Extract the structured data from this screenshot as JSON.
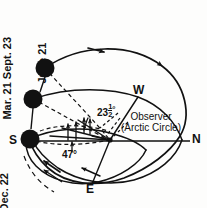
{
  "figure": {
    "kind": "astronomy-diagram",
    "background_color": "#fdfdfc",
    "ink_color": "#111111"
  },
  "cardinals": {
    "south": "S",
    "north": "N",
    "west": "W",
    "east": "E"
  },
  "date_labels": {
    "equinox": "Mar. 21 Sept. 23",
    "summer_solstice": "June 21",
    "winter_solstice": "Dec. 22"
  },
  "angles": {
    "tilt_whole": "23",
    "tilt_fraction_numerator": "1",
    "tilt_fraction_denominator": "2",
    "tilt_degree_symbol": "°",
    "tilt_full": "23½°",
    "altitude": "47°"
  },
  "observer": {
    "line1": "Observer",
    "line2": "(Arctic Circle)"
  },
  "suns": [
    {
      "name": "sun-june-21",
      "cx": 45,
      "cy": 68,
      "r": 9.5
    },
    {
      "name": "sun-equinox",
      "cx": 33,
      "cy": 99,
      "r": 9.5
    },
    {
      "name": "sun-dec-22",
      "cx": 30,
      "cy": 139,
      "r": 9.5
    }
  ],
  "horizon": {
    "x1": 24,
    "y1": 141,
    "x2": 190,
    "y2": 141
  },
  "observer_point": {
    "x": 110,
    "y": 140
  }
}
